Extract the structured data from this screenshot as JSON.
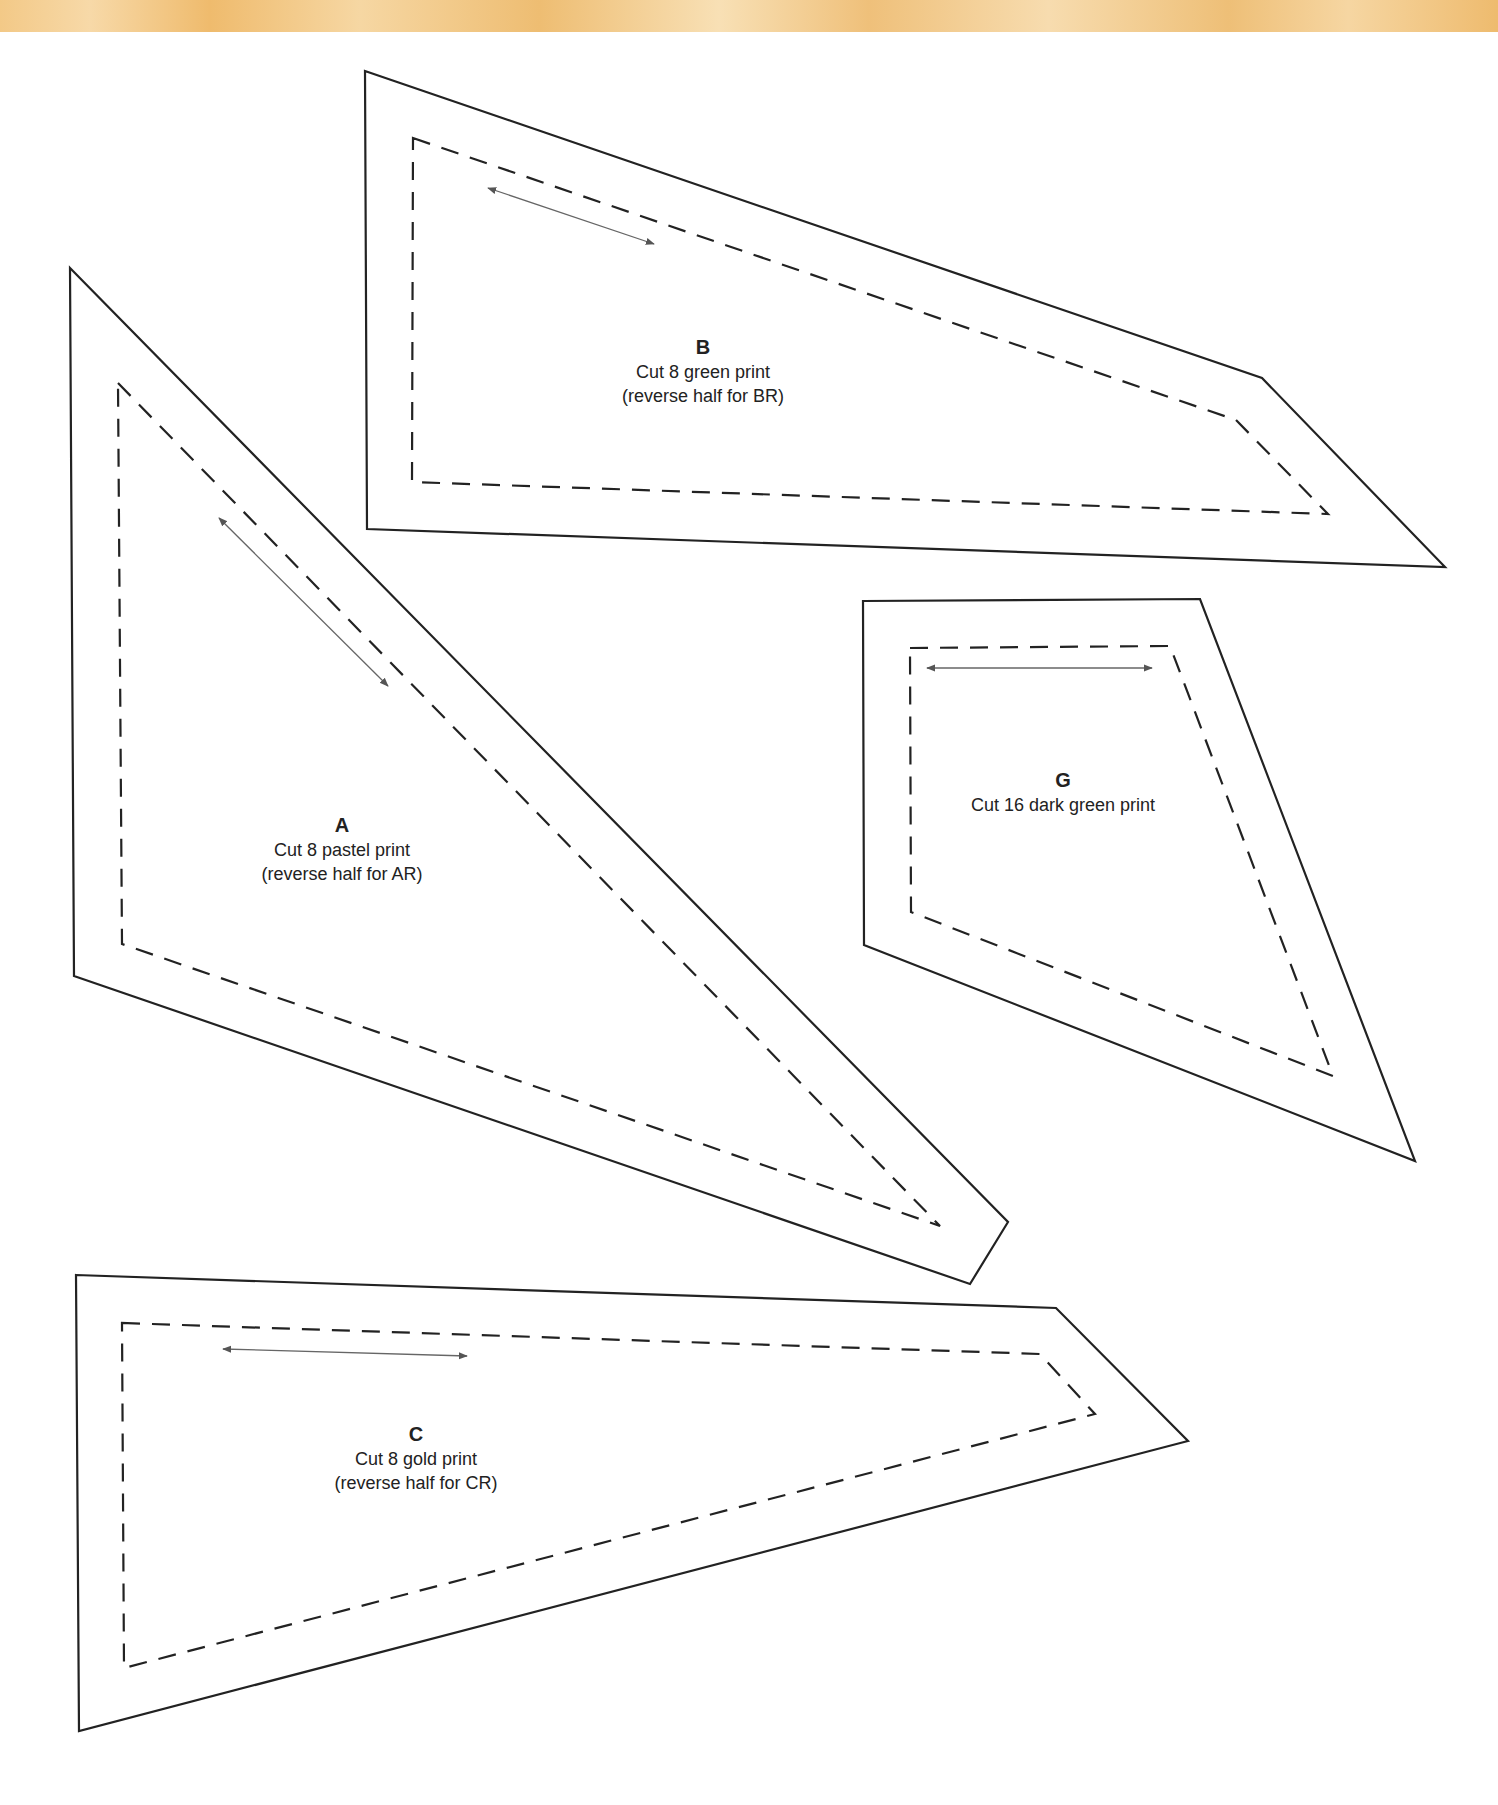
{
  "banner": {
    "color": "#f2c98a"
  },
  "pieces": [
    {
      "id": "A",
      "letter": "A",
      "instruction": "Cut 8 pastel print",
      "note": "(reverse half for AR)"
    },
    {
      "id": "B",
      "letter": "B",
      "instruction": "Cut 8 green print",
      "note": "(reverse half for BR)"
    },
    {
      "id": "G",
      "letter": "G",
      "instruction": "Cut 16 dark green print"
    },
    {
      "id": "C",
      "letter": "C",
      "instruction": "Cut 8 gold print",
      "note": "(reverse half for CR)"
    }
  ]
}
